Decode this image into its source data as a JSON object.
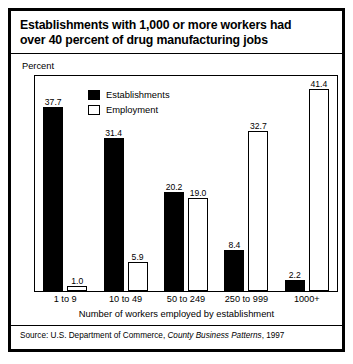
{
  "figure": {
    "title_lines": [
      "Establishments with 1,000 or more workers had",
      "over 40 percent of drug manufacturing jobs"
    ],
    "unit_label": "Percent",
    "source_prefix": "Source: U.S. Department of Commerce, ",
    "source_italic": "County Business Patterns",
    "source_suffix": ", 1997"
  },
  "chart_data": {
    "type": "bar",
    "title": "Establishments with 1,000 or more workers had over 40 percent of drug manufacturing jobs",
    "subtitle": "",
    "xlabel": "Number of workers employed by establishment",
    "ylabel": "Percent",
    "ylim": [
      0,
      44
    ],
    "grid": false,
    "legend_position": "top-left-inside",
    "categories": [
      "1 to 9",
      "10 to 49",
      "50 to 249",
      "250 to 999",
      "1000+"
    ],
    "series": [
      {
        "name": "Establishments",
        "color": "#000000",
        "style": "filled",
        "values": [
          37.7,
          31.4,
          20.2,
          8.4,
          2.2
        ],
        "labels": [
          "37.7",
          "31.4",
          "20.2",
          "8.4",
          "2.2"
        ]
      },
      {
        "name": "Employment",
        "color": "#ffffff",
        "style": "hollow",
        "values": [
          1.0,
          5.9,
          19.0,
          32.7,
          41.4
        ],
        "labels": [
          "1.0",
          "5.9",
          "19.0",
          "32.7",
          "41.4"
        ]
      }
    ],
    "annotations": [],
    "source": "Source: U.S. Department of Commerce, County Business Patterns, 1997"
  }
}
